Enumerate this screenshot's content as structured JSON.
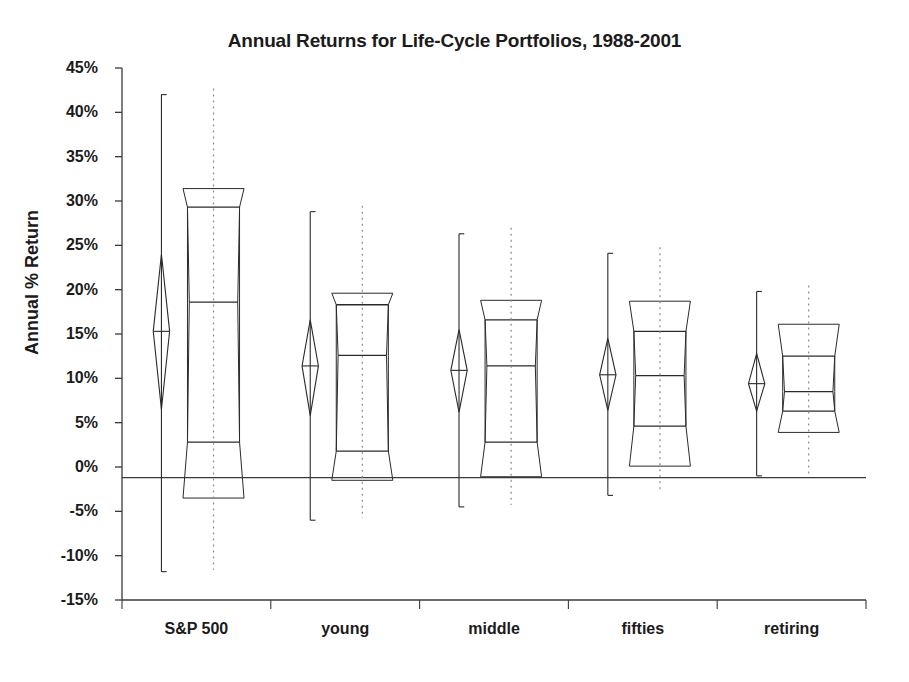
{
  "chart_data": {
    "type": "box",
    "title": "Annual Returns for Life-Cycle Portfolios, 1988-2001",
    "xlabel": "",
    "ylabel": "Annual % Return",
    "ylim": [
      -15,
      45
    ],
    "ytick_step": 5,
    "ytick_labels": [
      "45%",
      "40%",
      "35%",
      "30%",
      "25%",
      "20%",
      "15%",
      "10%",
      "5%",
      "0%",
      "-5%",
      "-10%",
      "-15%"
    ],
    "ytick_values": [
      45,
      40,
      35,
      30,
      25,
      20,
      15,
      10,
      5,
      0,
      -5,
      -10,
      -15
    ],
    "categories": [
      "S&P 500",
      "young",
      "middle",
      "fifties",
      "retiring"
    ],
    "grid": false,
    "legend": "none",
    "value_unit": "percent",
    "reference_line": -1.2,
    "series": [
      {
        "name": "S&P 500",
        "min": -11.8,
        "q1": 2.8,
        "median": 18.6,
        "q3": 29.3,
        "max": 42.0,
        "notch_upper": 31.4,
        "notch_lower": -3.5,
        "mean": 15.3,
        "mean_ci_upper": 24.0,
        "mean_ci_lower": 6.5
      },
      {
        "name": "young",
        "min": -6.0,
        "q1": 1.8,
        "median": 12.6,
        "q3": 18.3,
        "max": 28.8,
        "notch_upper": 19.6,
        "notch_lower": -1.5,
        "mean": 11.4,
        "mean_ci_upper": 16.6,
        "mean_ci_lower": 5.8
      },
      {
        "name": "middle",
        "min": -4.5,
        "q1": 2.8,
        "median": 11.4,
        "q3": 16.6,
        "max": 26.3,
        "notch_upper": 18.8,
        "notch_lower": -1.1,
        "mean": 10.9,
        "mean_ci_upper": 15.5,
        "mean_ci_lower": 6.2
      },
      {
        "name": "fifties",
        "min": -3.2,
        "q1": 4.6,
        "median": 10.3,
        "q3": 15.3,
        "max": 24.1,
        "notch_upper": 18.7,
        "notch_lower": 0.1,
        "mean": 10.4,
        "mean_ci_upper": 14.5,
        "mean_ci_lower": 6.4
      },
      {
        "name": "retiring",
        "min": -1.0,
        "q1": 6.3,
        "median": 8.5,
        "q3": 12.5,
        "max": 19.8,
        "notch_upper": 16.1,
        "notch_lower": 3.9,
        "mean": 9.4,
        "mean_ci_upper": 12.8,
        "mean_ci_lower": 6.3
      }
    ]
  },
  "style": {
    "line_color": "#2a2a2a",
    "axis_color": "#3a3a3a",
    "grid_color": "#8a8a8a",
    "background": "#ffffff"
  }
}
